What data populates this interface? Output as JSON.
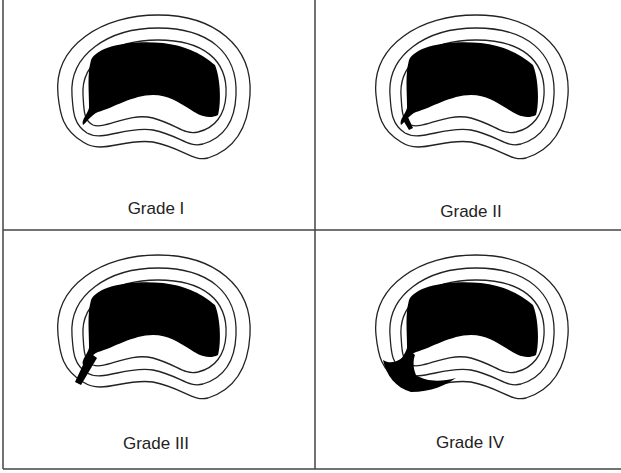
{
  "figure": {
    "panels": [
      {
        "id": "grade-1",
        "label": "Grade I"
      },
      {
        "id": "grade-2",
        "label": "Grade II"
      },
      {
        "id": "grade-3",
        "label": "Grade III"
      },
      {
        "id": "grade-4",
        "label": "Grade IV"
      }
    ],
    "colors": {
      "line": "#222222",
      "fill": "#000000",
      "border": "#444444"
    }
  }
}
